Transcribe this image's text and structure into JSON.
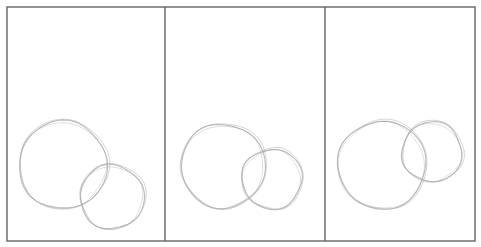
{
  "figure": {
    "frame": {
      "x": 7,
      "y": 7,
      "width": 468,
      "height": 234,
      "stroke": "#6e6e6e"
    },
    "dividers": [
      165,
      325
    ],
    "panels": [
      {
        "id": "panel-1",
        "large_circle": {
          "cx": 63,
          "cy": 165,
          "r": 44
        },
        "small_circle": {
          "cx": 112,
          "cy": 197,
          "r": 32
        }
      },
      {
        "id": "panel-2",
        "large_circle": {
          "cx": 223,
          "cy": 166,
          "r": 42
        },
        "small_circle": {
          "cx": 272,
          "cy": 179,
          "r": 30
        }
      },
      {
        "id": "panel-3",
        "large_circle": {
          "cx": 382,
          "cy": 165,
          "r": 44
        },
        "small_circle": {
          "cx": 432,
          "cy": 152,
          "r": 30
        }
      }
    ],
    "colors": {
      "frame": "#6e6e6e",
      "sketch": "#b4b4b4",
      "sketch_dark": "#9a9a9a",
      "background": "#ffffff"
    }
  }
}
